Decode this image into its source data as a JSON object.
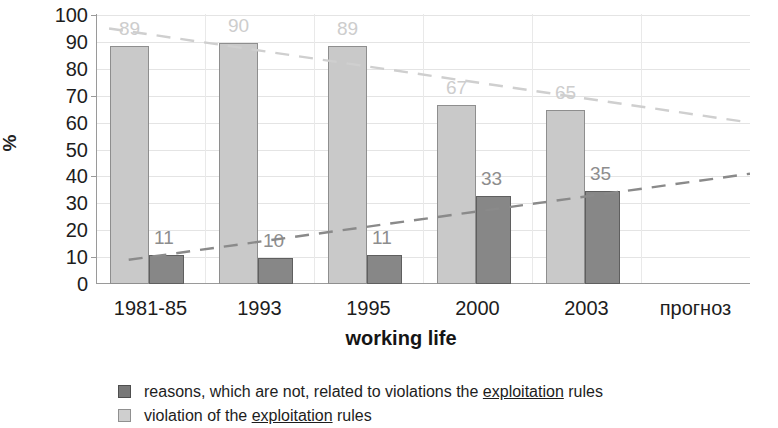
{
  "chart_data": {
    "type": "bar",
    "title": "",
    "xlabel": "working life",
    "ylabel": "%",
    "ylim": [
      0,
      100
    ],
    "ytick_step": 10,
    "grid": true,
    "legend_position": "bottom",
    "categories": [
      "1981-85",
      "1993",
      "1995",
      "2000",
      "2003",
      "прогноз"
    ],
    "yticks": [
      "100",
      "90",
      "80",
      "70",
      "60",
      "50",
      "40",
      "30",
      "20",
      "10",
      "0"
    ],
    "series": [
      {
        "name": "violation of the exploitation rules",
        "color": "#c9c9c9",
        "values": [
          89,
          90,
          89,
          67,
          65,
          null
        ],
        "labels": [
          "89",
          "90",
          "89",
          "67",
          "65",
          ""
        ]
      },
      {
        "name": "reasons, which are not, related to violations the exploitation rules",
        "color": "#878787",
        "values": [
          11,
          10,
          11,
          33,
          35,
          null
        ],
        "labels": [
          "11",
          "10",
          "11",
          "33",
          "35",
          ""
        ]
      }
    ],
    "trendlines": [
      {
        "name": "violation-trend",
        "style": "dashed",
        "color": "#cfcfcf",
        "x_start_pct": 2,
        "x_end_pct": 100,
        "y_start": 95,
        "y_end": 60
      },
      {
        "name": "reasons-trend",
        "style": "dashed",
        "color": "#8a8a8a",
        "x_start_pct": 5,
        "x_end_pct": 100,
        "y_start": 9,
        "y_end": 41
      }
    ]
  },
  "legend": {
    "items": [
      {
        "swatch": "dark",
        "text_before": "reasons, which are not, related to violations the ",
        "spellcheck_word": "exploitation",
        "text_after": " rules"
      },
      {
        "swatch": "light",
        "text_before": "violation of the ",
        "spellcheck_word": "exploitation",
        "text_after": " rules"
      }
    ]
  },
  "axis": {
    "y_title": "%",
    "x_title": "working life"
  }
}
